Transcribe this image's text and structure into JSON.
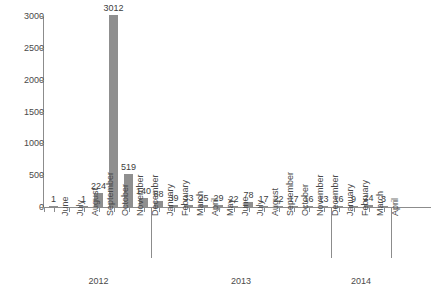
{
  "chart_data": {
    "type": "bar",
    "title": "",
    "xlabel": "",
    "ylabel": "",
    "ylim": [
      0,
      3000
    ],
    "grid": false,
    "legend": false,
    "y_ticks": [
      0,
      500,
      1000,
      1500,
      2000,
      2500,
      3000
    ],
    "y_tick_labels": [
      "0",
      "500",
      "1000",
      "1500",
      "2000",
      "2500",
      "3000"
    ],
    "categories": [
      "June",
      "July",
      "August",
      "September",
      "October",
      "November",
      "December",
      "January",
      "February",
      "March",
      "April",
      "May",
      "June",
      "July",
      "August",
      "September",
      "October",
      "November",
      "December",
      "January",
      "February",
      "March",
      "April"
    ],
    "values": [
      1,
      0,
      1,
      224,
      3012,
      519,
      140,
      88,
      39,
      33,
      25,
      29,
      22,
      78,
      17,
      22,
      17,
      16,
      13,
      16,
      9,
      24,
      3
    ],
    "value_labels": [
      "1",
      "",
      "1",
      "224",
      "3012",
      "519",
      "140",
      "88",
      "39",
      "33",
      "25",
      "29",
      "22",
      "78",
      "17",
      "22",
      "17",
      "16",
      "13",
      "16",
      "9",
      "24",
      "3"
    ],
    "groups": [
      {
        "label": "2012",
        "start": 0,
        "end": 6
      },
      {
        "label": "2013",
        "start": 7,
        "end": 18
      },
      {
        "label": "2014",
        "start": 19,
        "end": 22
      }
    ],
    "colors": {
      "bar": "#8f8f8f",
      "axis": "#8c8c8c",
      "text": "#4a4a4a",
      "background": "#ffffff"
    }
  }
}
